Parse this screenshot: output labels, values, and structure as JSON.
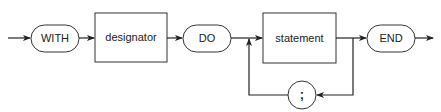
{
  "diagram": {
    "type": "syntax-diagram",
    "nodes": {
      "with": {
        "label": "WITH",
        "kind": "terminal"
      },
      "designator": {
        "label": "designator",
        "kind": "nonterminal"
      },
      "do": {
        "label": "DO",
        "kind": "terminal"
      },
      "statement": {
        "label": "statement",
        "kind": "nonterminal"
      },
      "semicolon": {
        "label": ";",
        "kind": "terminal"
      },
      "end": {
        "label": "END",
        "kind": "terminal"
      }
    },
    "edges": [
      [
        "entry",
        "with"
      ],
      [
        "with",
        "designator"
      ],
      [
        "designator",
        "do"
      ],
      [
        "do",
        "statement"
      ],
      [
        "statement",
        "end"
      ],
      [
        "statement",
        "semicolon"
      ],
      [
        "semicolon",
        "statement"
      ],
      [
        "end",
        "exit"
      ]
    ]
  }
}
